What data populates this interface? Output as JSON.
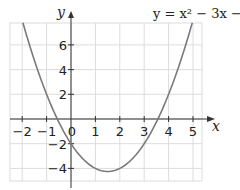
{
  "chart_data": {
    "type": "line",
    "title": "y = x² − 3x − 2",
    "equation": {
      "a": 1,
      "b": -3,
      "c": -2
    },
    "xlabel": "x",
    "ylabel": "y",
    "x_ticks": [
      -2,
      -1,
      0,
      1,
      2,
      3,
      4,
      5
    ],
    "x_tick_labels": [
      "−2",
      "−1",
      "0",
      "1",
      "2",
      "3",
      "4",
      "5"
    ],
    "y_ticks": [
      -4,
      -2,
      2,
      4,
      6
    ],
    "y_tick_labels": [
      "−4",
      "−2",
      "2",
      "4",
      "6"
    ],
    "xlim": [
      -2.5,
      5.4
    ],
    "ylim": [
      -5,
      7.8
    ],
    "grid": true,
    "series": [
      {
        "name": "y = x² − 3x − 2",
        "x": [
          -2,
          -1.5,
          -1,
          -0.5,
          0,
          0.5,
          1,
          1.5,
          2,
          2.5,
          3,
          3.5,
          4,
          4.5,
          5
        ],
        "y": [
          8,
          4.75,
          2,
          -0.25,
          -2,
          -3.25,
          -4,
          -4.25,
          -4,
          -3.25,
          -2,
          -0.25,
          2,
          4.75,
          8
        ]
      }
    ],
    "colors": {
      "curve": "#7a7a7a",
      "grid": "#dcdcdc",
      "axis": "#333333"
    }
  }
}
